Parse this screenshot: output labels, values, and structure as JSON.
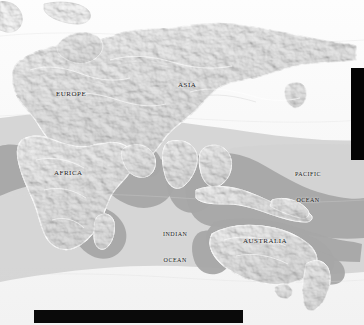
{
  "figure": {
    "kind": "shaded-relief-world-map",
    "hemisphere": "Eastern Hemisphere",
    "projection_note": "equirectangular-style world map, grayscale relief",
    "background_color": "#fbfbfb",
    "land_color": "#e9e9e9",
    "ocean_color": "#f7f7f7",
    "range_overlay_color": "#a8a8a8",
    "range_overlay_dark_color": "#8f8f8f",
    "label_color": "#1a1a1a",
    "bar_color": "#040404"
  },
  "labels": {
    "continents": [
      {
        "id": "europe",
        "text": "Europe"
      },
      {
        "id": "asia",
        "text": "Asia"
      },
      {
        "id": "africa",
        "text": "Africa"
      },
      {
        "id": "australia",
        "text": "Australia"
      }
    ],
    "oceans": [
      {
        "id": "indian",
        "line1": "Indian",
        "line2": "Ocean"
      },
      {
        "id": "pacific",
        "line1": "Pacific",
        "line2": "Ocean"
      }
    ]
  },
  "overlays": {
    "right_bar": {
      "name": "right-black-bar",
      "color": "#040404"
    },
    "bottom_bar": {
      "name": "bottom-black-bar",
      "color": "#0a0a0a"
    }
  }
}
